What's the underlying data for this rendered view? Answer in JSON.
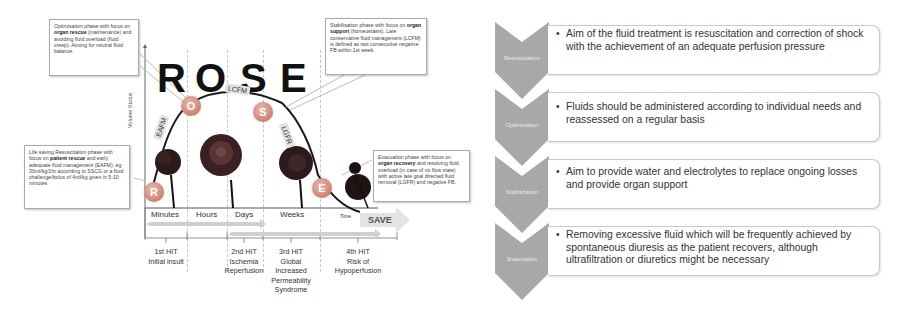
{
  "rose_diagram": {
    "title_letters": [
      "R",
      "O",
      "S",
      "E"
    ],
    "y_axis_label": "Volume Status",
    "x_axis_end_label": "Time",
    "phases": {
      "R": "R",
      "O": "O",
      "S": "S",
      "E": "E"
    },
    "tags": {
      "eafm": "EAFM",
      "lcfm": "LCFM",
      "lgfr": "LGFR"
    },
    "time_labels": [
      "Minutes",
      "Hours",
      "Days",
      "Weeks"
    ],
    "save_label": "SAVE",
    "callouts": {
      "optimisation": {
        "pre": "Optimisation phase with focus on ",
        "bold": "organ rescue",
        "post": " (maintenance) and avoiding fluid overload (fluid creep). Aiming for neutral fluid balance."
      },
      "stabilisation": {
        "pre": "Stabilisation phase with focus on ",
        "bold": "organ support",
        "post": " (homeostasis). Late conservative fluid management (LCFM) is defined as two consecutive negative FB within 1st week."
      },
      "resuscitation": {
        "pre": "Life saving Resuscitation phase with focus on ",
        "bold": "patient rescue",
        "post": " and early adequate fluid management (EAFM), eg 30ml/kg/1hr according to SSCG or a fluid challenge/bolus of 4ml/kg given in 5-10 minutes"
      },
      "evacuation": {
        "pre": "Evacuation phase with focus on ",
        "bold": "organ recovery",
        "post": " and resolving fluid overload (in case of no flow state) with active late goal directed fluid removal (LGFR) and negative FB."
      }
    },
    "hits": [
      {
        "title": "1st HIT",
        "lines": [
          "Initial insult"
        ]
      },
      {
        "title": "2nd HIT",
        "lines": [
          "Ischemia",
          "Reperfusion"
        ]
      },
      {
        "title": "3rd HIT",
        "lines": [
          "Global",
          "Increased",
          "Permeability",
          "Syndrome"
        ]
      },
      {
        "title": "4th HIT",
        "lines": [
          "Risk of",
          "Hypoperfusion"
        ]
      }
    ]
  },
  "phase_list": {
    "items": [
      {
        "label": "Resuscitation",
        "text": "Aim of the fluid treatment is resuscitation and correction of shock with the achievement of an adequate perfusion pressure"
      },
      {
        "label": "Optimisation",
        "text": "Fluids should be administered according to individual needs and reassessed on a regular basis"
      },
      {
        "label": "Stabilization",
        "text": "Aim to provide water and electrolytes to replace ongoing losses and provide organ support"
      },
      {
        "label": "Evacuation",
        "text": "Removing excessive fluid which will be frequently achieved by spontaneous diuresis as the patient recovers, although ultrafiltration or diuretics might be necessary"
      }
    ],
    "bullet": "•"
  },
  "colors": {
    "phase_circle": "#cc8372",
    "chevron": "#a8a8a8",
    "arrow": "#d6d6d6",
    "tag": "#e2e2e2"
  }
}
